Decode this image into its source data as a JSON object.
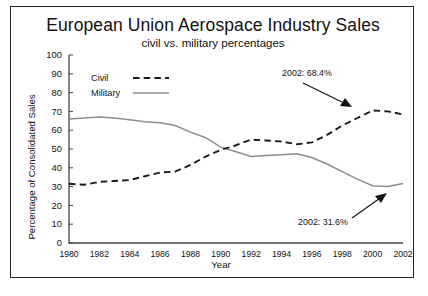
{
  "chart_data": {
    "type": "line",
    "title": "European Union Aerospace Industry Sales",
    "subtitle": "civil vs. military percentages",
    "xlabel": "Year",
    "ylabel": "Percentage of Consolidated Sales",
    "xlim": [
      1980,
      2002
    ],
    "ylim": [
      0,
      100
    ],
    "grid": false,
    "legend_position": "top-left inside plot",
    "x": [
      1980,
      1981,
      1982,
      1983,
      1984,
      1985,
      1986,
      1987,
      1988,
      1989,
      1990,
      1991,
      1992,
      1993,
      1994,
      1995,
      1996,
      1997,
      1998,
      1999,
      2000,
      2001,
      2002
    ],
    "xticks": [
      1980,
      1982,
      1984,
      1986,
      1988,
      1990,
      1992,
      1994,
      1996,
      1998,
      2000,
      2002
    ],
    "xtick_labels": [
      "1980",
      "1982",
      "1984",
      "1986",
      "1988",
      "1990",
      "1992",
      "1994",
      "1996",
      "1998",
      "2000",
      "2002"
    ],
    "yticks": [
      0,
      10,
      20,
      30,
      40,
      50,
      60,
      70,
      80,
      90,
      100
    ],
    "ytick_labels": [
      "0",
      "10",
      "20",
      "30",
      "40",
      "50",
      "60",
      "70",
      "80",
      "90",
      "100"
    ],
    "series": [
      {
        "name": "Civil",
        "style": "dashed",
        "color": "#1a1a1a",
        "values": [
          31.5,
          31.0,
          32.5,
          33.0,
          33.5,
          35.5,
          37.5,
          38.0,
          41.5,
          46.0,
          49.5,
          52.0,
          55.0,
          54.5,
          54.0,
          52.5,
          53.5,
          57.5,
          62.5,
          66.5,
          70.5,
          70.0,
          68.4
        ]
      },
      {
        "name": "Military",
        "style": "solid",
        "color": "#8d8d8d",
        "values": [
          66.0,
          66.5,
          67.0,
          66.5,
          65.5,
          64.5,
          64.0,
          62.5,
          59.0,
          56.0,
          51.0,
          48.5,
          46.0,
          46.5,
          47.0,
          47.5,
          45.5,
          42.0,
          38.0,
          34.0,
          30.5,
          30.0,
          31.6
        ]
      }
    ],
    "annotations": [
      {
        "text": "2002: 68.4%",
        "series": "Civil",
        "year": 2002,
        "value": 68.4
      },
      {
        "text": "2002: 31.6%",
        "series": "Military",
        "year": 2002,
        "value": 31.6
      }
    ]
  },
  "legend": {
    "items": [
      {
        "label": "Civil"
      },
      {
        "label": "Military"
      }
    ]
  }
}
